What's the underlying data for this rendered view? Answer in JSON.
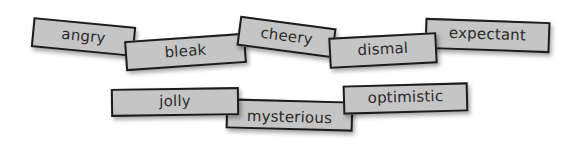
{
  "cards": [
    {
      "id": "angry",
      "label": "angry"
    },
    {
      "id": "bleak",
      "label": "bleak"
    },
    {
      "id": "cheery",
      "label": "cheery"
    },
    {
      "id": "dismal",
      "label": "dismal"
    },
    {
      "id": "expectant",
      "label": "expectant"
    },
    {
      "id": "jolly",
      "label": "jolly"
    },
    {
      "id": "mysterious",
      "label": "mysterious"
    },
    {
      "id": "optimistic",
      "label": "optimistic"
    }
  ],
  "colors": {
    "card_fill": "#c5c5c5",
    "card_border": "#1c1c1c",
    "text": "#2b2b2b",
    "background": "#ffffff"
  }
}
